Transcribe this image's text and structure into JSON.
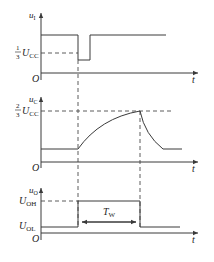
{
  "diagram": {
    "panels": [
      {
        "id": "input",
        "y_label": "u",
        "y_label_sub": "I",
        "level_label_frac_num": "1",
        "level_label_frac_den": "3",
        "level_label": "U",
        "level_label_sub": "CC",
        "origin": "O",
        "x_label": "t"
      },
      {
        "id": "capacitor",
        "y_label": "u",
        "y_label_sub": "C",
        "level_label_frac_num": "2",
        "level_label_frac_den": "3",
        "level_label": "U",
        "level_label_sub": "CC",
        "origin": "O",
        "x_label": "t"
      },
      {
        "id": "output",
        "y_label": "u",
        "y_label_sub": "O",
        "high_label": "U",
        "high_label_sub": "OH",
        "low_label": "U",
        "low_label_sub": "OL",
        "pulse_width_label": "T",
        "pulse_width_sub": "W",
        "origin": "O",
        "x_label": "t"
      }
    ],
    "colors": {
      "line": "#3a3a3a",
      "background": "#ffffff"
    }
  }
}
